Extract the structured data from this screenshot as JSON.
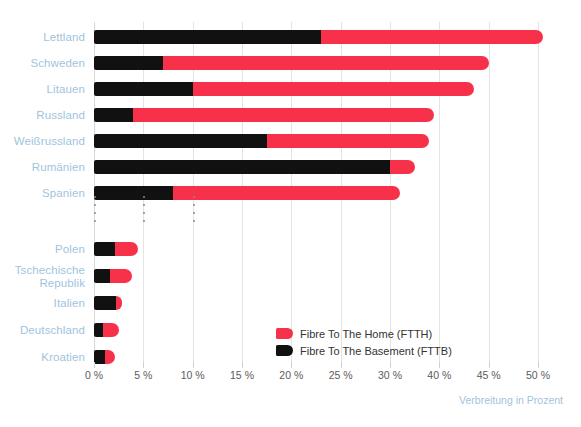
{
  "chart_data": {
    "type": "bar",
    "orientation": "horizontal",
    "stacked": true,
    "title": "",
    "subtitle": "",
    "xlabel": "Verbreitung in Prozent",
    "ylabel": "",
    "xlim": [
      0,
      45
    ],
    "grid": true,
    "legend_position": "inside-bottom-center",
    "axis_break": true,
    "axis_break_after_category": "Spanien",
    "tick_values": [
      0,
      5,
      10,
      15,
      20,
      25,
      30,
      35,
      40,
      45
    ],
    "tick_labels": [
      "0 %",
      "5 %",
      "10 %",
      "15 %",
      "20 %",
      "25 %",
      "30 %",
      "40 %",
      "45 %",
      "50 %"
    ],
    "categories": [
      "Lettland",
      "Schweden",
      "Litauen",
      "Russland",
      "Weißrussland",
      "Rumänien",
      "Spanien",
      "Polen",
      "Tschechische\nRepublik",
      "Italien",
      "Deutschland",
      "Kroatien"
    ],
    "series": [
      {
        "name": "Fibre To The Basement (FTTB)",
        "key": "ftbb",
        "color": "#111111",
        "values": [
          23.0,
          7.0,
          10.0,
          4.0,
          17.5,
          30.0,
          8.0,
          2.1,
          1.6,
          2.2,
          0.9,
          1.1
        ]
      },
      {
        "name": "Fibre To The Home (FTTH)",
        "key": "ftth",
        "color": "#f8314b",
        "values": [
          22.5,
          33.0,
          28.5,
          30.5,
          16.5,
          2.5,
          23.0,
          2.4,
          2.3,
          0.6,
          1.6,
          1.0
        ]
      }
    ],
    "totals": [
      45.5,
      40.0,
      38.5,
      34.5,
      34.0,
      32.5,
      31.0,
      4.5,
      3.9,
      2.8,
      2.5,
      2.1
    ]
  },
  "legend": {
    "items": [
      {
        "label": "Fibre To The Home (FTTH)",
        "swatch": "ftth"
      },
      {
        "label": "Fibre To The Basement (FTTB)",
        "swatch": "ftbb"
      }
    ]
  },
  "axis": {
    "title": "Verbreitung in Prozent"
  },
  "colors": {
    "ftth": "#f8314b",
    "ftbb": "#111111",
    "category_label": "#9fc4dd",
    "tick_label": "#5b5b5b",
    "gridline": "#e3e3e3"
  }
}
